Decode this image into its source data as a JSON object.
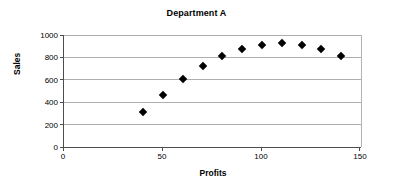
{
  "chart_data": {
    "type": "scatter",
    "title": "Department A",
    "xlabel": "Profits",
    "ylabel": "Sales",
    "xlim": [
      0,
      150
    ],
    "ylim": [
      0,
      1000
    ],
    "xticks": [
      0,
      50,
      100,
      150
    ],
    "yticks": [
      0,
      200,
      400,
      600,
      800,
      1000
    ],
    "grid": "horizontal",
    "legend": "none",
    "marker": "filled-diamond",
    "marker_color": "#000000",
    "x": [
      40,
      50,
      60,
      70,
      80,
      90,
      100,
      110,
      120,
      130,
      140
    ],
    "y": [
      310,
      465,
      605,
      720,
      810,
      875,
      915,
      925,
      915,
      875,
      810
    ],
    "points": [
      {
        "x": 40,
        "y": 310
      },
      {
        "x": 50,
        "y": 465
      },
      {
        "x": 60,
        "y": 605
      },
      {
        "x": 70,
        "y": 720
      },
      {
        "x": 80,
        "y": 810
      },
      {
        "x": 90,
        "y": 875
      },
      {
        "x": 100,
        "y": 915
      },
      {
        "x": 110,
        "y": 925
      },
      {
        "x": 120,
        "y": 915
      },
      {
        "x": 130,
        "y": 875
      },
      {
        "x": 140,
        "y": 810
      }
    ]
  },
  "axes": {
    "y_tick_labels": [
      "1000",
      "800",
      "600",
      "400",
      "200",
      "0"
    ],
    "x_tick_labels": [
      "0",
      "50",
      "100",
      "150"
    ]
  },
  "colors": {
    "marker": "#000000",
    "gridline": "#aeaeae",
    "axis": "#4d4d4d",
    "background": "#ffffff"
  }
}
